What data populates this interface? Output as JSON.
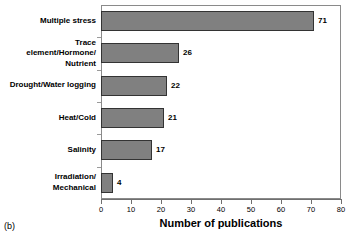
{
  "chart_data": {
    "type": "bar",
    "orientation": "horizontal",
    "title": "",
    "subtitle": "",
    "xlabel": "Number of publications",
    "ylabel": "",
    "xlim": [
      0,
      80
    ],
    "ylim": null,
    "grid": false,
    "legend": null,
    "xticks": [
      0,
      10,
      20,
      30,
      40,
      50,
      60,
      70,
      80
    ],
    "categories": [
      "Multiple stress",
      "Trace element/Hormone/ Nutrient",
      "Drought/Water logging",
      "Heat/Cold",
      "Salinity",
      "Irradiation/ Mechanical"
    ],
    "category_labels_display": [
      "Multiple stress",
      "Trace\nelement/Hormone/\nNutrient",
      "Drought/Water logging",
      "Heat/Cold",
      "Salinity",
      "Irradiation/\nMechanical"
    ],
    "values": [
      71,
      26,
      22,
      21,
      17,
      4
    ],
    "value_labels": [
      "71",
      "26",
      "22",
      "21",
      "17",
      "4"
    ],
    "bar_color": "#808080",
    "bar_border_color": "#333333",
    "axis_color": "#8a8a8a",
    "background_color": "#ffffff"
  },
  "panel": {
    "label": "(b)"
  }
}
